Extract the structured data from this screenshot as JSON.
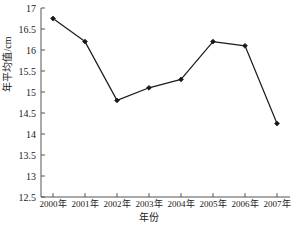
{
  "chart_data": {
    "type": "line",
    "title": "",
    "subtitle": "",
    "xlabel": "年份",
    "ylabel": "年平均值/cm",
    "categories": [
      "2000年",
      "2001年",
      "2002年",
      "2003年",
      "2004年",
      "2005年",
      "2006年",
      "2007年"
    ],
    "x": [
      2000,
      2001,
      2002,
      2003,
      2004,
      2005,
      2006,
      2007
    ],
    "values": [
      16.75,
      16.2,
      14.8,
      15.1,
      15.3,
      16.2,
      16.1,
      14.25
    ],
    "series": [
      {
        "name": "年平均值",
        "values": [
          16.75,
          16.2,
          14.8,
          15.1,
          15.3,
          16.2,
          16.1,
          14.25
        ]
      }
    ],
    "ylim": [
      12.5,
      17
    ],
    "ytick_values": [
      12.5,
      13,
      13.5,
      14,
      14.5,
      15,
      15.5,
      16,
      16.5,
      17
    ],
    "ytick_labels": [
      "12.5",
      "13",
      "13.5",
      "14",
      "14.5",
      "15",
      "15.5",
      "16",
      "16.5",
      "17"
    ],
    "grid": false,
    "legend": false,
    "legend_position": "none",
    "marker": "diamond",
    "line_color": "#1a1a1a",
    "marker_color": "#1a1a1a",
    "axis_color": "#555555",
    "background_color": "#ffffff"
  }
}
